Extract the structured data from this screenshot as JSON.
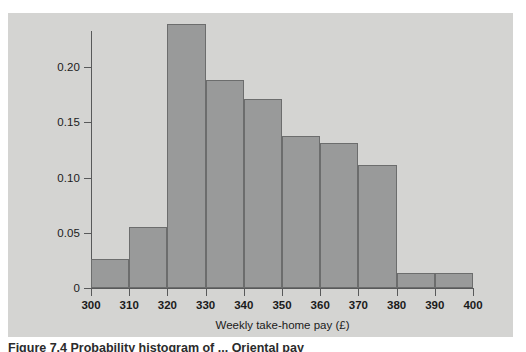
{
  "figure": {
    "caption": "Figure 7.4  Probability histogram of ... Oriental pay",
    "panel_bg": "#d4d4d2",
    "page_bg": "#ffffff"
  },
  "chart_data": {
    "type": "bar",
    "title": "",
    "subtitle": "",
    "xlabel": "Weekly take-home pay (£)",
    "ylabel": "",
    "grid": false,
    "legend": null,
    "bar_style": {
      "fill": "#999a9a",
      "edge": "#6c6d6d"
    },
    "axis_color": "#58595a",
    "bin_width": 10,
    "bin_edges": [
      300,
      310,
      320,
      330,
      340,
      350,
      360,
      370,
      380,
      390,
      400
    ],
    "categories": [
      "300-310",
      "310-320",
      "320-330",
      "330-340",
      "340-350",
      "350-360",
      "360-370",
      "370-380",
      "380-390",
      "390-400"
    ],
    "values": [
      0.024,
      0.05,
      0.216,
      0.17,
      0.155,
      0.124,
      0.119,
      0.101,
      0.012,
      0.012
    ],
    "xlim": [
      300,
      400
    ],
    "ylim": [
      0,
      0.225
    ],
    "xticks": [
      300,
      310,
      320,
      330,
      340,
      350,
      360,
      370,
      380,
      390,
      400
    ],
    "xticklabels": [
      "300",
      "310",
      "320",
      "330",
      "340",
      "350",
      "360",
      "370",
      "380",
      "390",
      "400"
    ],
    "yticks": [
      0,
      0.05,
      0.1,
      0.15,
      0.2
    ],
    "yticklabels": [
      "0",
      "0.05",
      "0.10",
      "0.15",
      "0.20"
    ]
  }
}
